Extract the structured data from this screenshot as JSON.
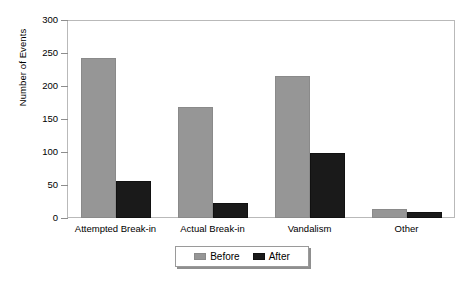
{
  "chart_data": {
    "type": "bar",
    "title": "",
    "subtitle": "",
    "xlabel": "",
    "ylabel": "Number of Events",
    "categories": [
      "Attempted Break-in",
      "Actual Break-in",
      "Vandalism",
      "Other"
    ],
    "series": [
      {
        "name": "Before",
        "color": "#969696",
        "values": [
          242,
          168,
          215,
          14
        ]
      },
      {
        "name": "After",
        "color": "#1a1a1a",
        "values": [
          56,
          23,
          98,
          9
        ]
      }
    ],
    "ylim": [
      0,
      300
    ],
    "yticks": [
      0,
      50,
      100,
      150,
      200,
      250,
      300
    ],
    "ytick_labels": [
      "0",
      "50",
      "100",
      "150",
      "200",
      "250",
      "300"
    ],
    "grid": false,
    "legend_position": "bottom-center",
    "frame_color": "#b9b9b9",
    "background": "#ffffff"
  },
  "axes": {
    "y_title": "Number of Events"
  },
  "legend": {
    "entries": [
      {
        "label": "Before",
        "swatch": "legend-swatch-before"
      },
      {
        "label": "After",
        "swatch": "legend-swatch-after"
      }
    ]
  }
}
